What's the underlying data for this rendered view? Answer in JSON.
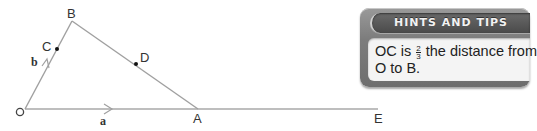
{
  "diagram": {
    "points": {
      "O": {
        "label": "O"
      },
      "A": {
        "label": "A"
      },
      "B": {
        "label": "B"
      },
      "C": {
        "label": "C"
      },
      "D": {
        "label": "D"
      },
      "E": {
        "label": "E"
      }
    },
    "vectors": {
      "a": {
        "label": "a"
      },
      "b": {
        "label": "b"
      }
    },
    "line_color": "#a0a0a0",
    "dot_color": "#111111"
  },
  "hints": {
    "title": "HINTS AND TIPS",
    "text_before": "OC is",
    "fraction": {
      "numerator": "2",
      "denominator": "3"
    },
    "text_after": "the distance from",
    "line2": "O to B."
  }
}
